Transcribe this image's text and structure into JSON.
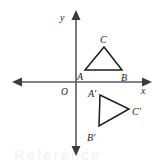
{
  "figure": {
    "background_color": "#ffffff",
    "axis_color": "#58595b",
    "shape_color": "#1d1d1f",
    "label_color": "#1a1a1a"
  },
  "axes": {
    "x_label": "x",
    "y_label": "y",
    "origin_label": "O",
    "x_axis": {
      "y": 82,
      "x_start": 12,
      "x_end": 152
    },
    "y_axis": {
      "x": 76,
      "y_start": 10,
      "y_end": 156
    },
    "x_label_pos": {
      "x": 143,
      "y": 93
    },
    "y_label_pos": {
      "x": 62,
      "y": 20
    },
    "origin_label_pos": {
      "x": 62,
      "y": 93
    },
    "ticks": [],
    "grid": false
  },
  "shapes": [
    {
      "name": "triangle-ABC",
      "vertices": [
        {
          "label": "A",
          "x": 85,
          "y": 70,
          "label_x": 78,
          "label_y": 79
        },
        {
          "label": "B",
          "x": 122,
          "y": 70,
          "label_x": 122,
          "label_y": 80
        },
        {
          "label": "C",
          "x": 104,
          "y": 47,
          "label_x": 100,
          "label_y": 43
        }
      ]
    },
    {
      "name": "triangle-A-prime-B-prime-C-prime",
      "vertices": [
        {
          "label": "A'",
          "x": 100,
          "y": 95,
          "label_x": 89,
          "label_y": 96
        },
        {
          "label": "B'",
          "x": 99,
          "y": 126,
          "label_x": 88,
          "label_y": 140
        },
        {
          "label": "C'",
          "x": 129,
          "y": 109,
          "label_x": 132,
          "label_y": 114
        }
      ]
    }
  ],
  "watermark": {
    "text": "Reference"
  }
}
